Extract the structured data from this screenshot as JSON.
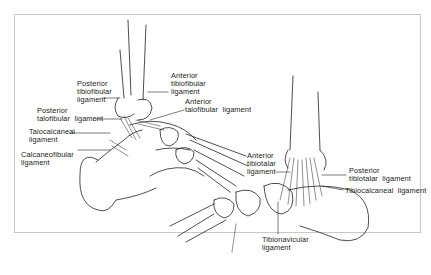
{
  "figure": {
    "lateral_view": {
      "labels": [
        {
          "id": "posterior-tibiofibular",
          "text": "Posterior\ntibiofibular\nligament"
        },
        {
          "id": "anterior-tibiofibular",
          "text": "Anterior\ntibiofibular\nligament"
        },
        {
          "id": "posterior-talofibular",
          "text": "Posterior\ntalofibular  ligament"
        },
        {
          "id": "anterior-talofibular",
          "text": "Anterior\ntalofibular  ligament"
        },
        {
          "id": "talocalcaneal",
          "text": "Talocalcaneal\nligament"
        },
        {
          "id": "calcaneofibular",
          "text": "Calcaneofibular\nligament"
        }
      ]
    },
    "medial_view": {
      "labels": [
        {
          "id": "anterior-tibiotalar",
          "text": "Anterior\ntibiotalar\nligament"
        },
        {
          "id": "posterior-tibiotalar",
          "text": "Posterior\ntibiotalar  ligament"
        },
        {
          "id": "tibiocalcaneal",
          "text": "Tibiocalcaneal  ligament"
        },
        {
          "id": "tibionavicular",
          "text": "Tibionavicular\nligament"
        }
      ]
    },
    "colors": {
      "line": "#222222",
      "frame": "#c8c8c8",
      "background": "#ffffff"
    }
  }
}
